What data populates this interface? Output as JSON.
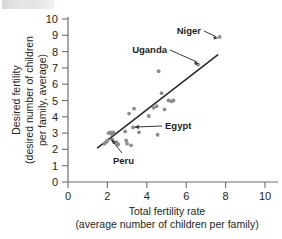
{
  "figure": {
    "background_color": "#ffffff",
    "ink_color": "#231f20",
    "axis_color": "#6f6e6f",
    "dot_color": "#8d8b8e",
    "trendline_color": "#2b2a2a"
  },
  "chart_data": {
    "type": "scatter",
    "title": "",
    "xlabel": "Total fertility rate",
    "xlabel_sub": "(average number of children per family)",
    "ylabel": "Desired fertility",
    "ylabel_sub_1": "(desired number of children",
    "ylabel_sub_2": "per family, average)",
    "xlim": [
      0,
      10
    ],
    "ylim": [
      0,
      10
    ],
    "xticks": [
      0,
      2,
      4,
      6,
      8,
      10
    ],
    "yticks": [
      0,
      1,
      2,
      3,
      4,
      5,
      6,
      7,
      8,
      9,
      10
    ],
    "xticklabels": [
      "0",
      "2",
      "4",
      "6",
      "8",
      "10"
    ],
    "yticklabels": [
      "0",
      "1",
      "2",
      "3",
      "4",
      "5",
      "6",
      "7",
      "8",
      "9",
      "10"
    ],
    "grid": false,
    "legend": false,
    "points": [
      {
        "x": 1.85,
        "y": 2.35
      },
      {
        "x": 1.95,
        "y": 2.45
      },
      {
        "x": 2.0,
        "y": 2.55
      },
      {
        "x": 2.05,
        "y": 3.0
      },
      {
        "x": 2.15,
        "y": 3.05
      },
      {
        "x": 2.2,
        "y": 2.95
      },
      {
        "x": 2.25,
        "y": 2.6
      },
      {
        "x": 2.3,
        "y": 3.05
      },
      {
        "x": 2.45,
        "y": 2.45
      },
      {
        "x": 2.5,
        "y": 2.35
      },
      {
        "x": 2.55,
        "y": 2.3
      },
      {
        "x": 2.9,
        "y": 3.1
      },
      {
        "x": 2.95,
        "y": 2.55
      },
      {
        "x": 3.0,
        "y": 2.35
      },
      {
        "x": 3.1,
        "y": 4.2
      },
      {
        "x": 3.2,
        "y": 2.25
      },
      {
        "x": 3.3,
        "y": 3.35
      },
      {
        "x": 3.35,
        "y": 4.5
      },
      {
        "x": 3.6,
        "y": 3.05
      },
      {
        "x": 4.1,
        "y": 4.05
      },
      {
        "x": 4.35,
        "y": 4.55
      },
      {
        "x": 4.5,
        "y": 4.65
      },
      {
        "x": 4.55,
        "y": 2.9
      },
      {
        "x": 4.6,
        "y": 6.8
      },
      {
        "x": 4.75,
        "y": 5.45
      },
      {
        "x": 4.9,
        "y": 4.45
      },
      {
        "x": 5.1,
        "y": 5.0
      },
      {
        "x": 5.25,
        "y": 4.95
      },
      {
        "x": 5.35,
        "y": 5.0
      },
      {
        "x": 6.6,
        "y": 7.2
      },
      {
        "x": 7.7,
        "y": 8.9
      }
    ],
    "trendline": {
      "x0": 1.5,
      "y0": 2.1,
      "x1": 7.6,
      "y1": 7.8
    },
    "annotations": [
      {
        "label": "Niger",
        "point_x": 7.7,
        "point_y": 8.9
      },
      {
        "label": "Uganda",
        "point_x": 6.6,
        "point_y": 7.2
      },
      {
        "label": "Egypt",
        "point_x": 3.3,
        "point_y": 3.35
      },
      {
        "label": "Peru",
        "point_x": 2.5,
        "point_y": 2.35
      }
    ]
  }
}
